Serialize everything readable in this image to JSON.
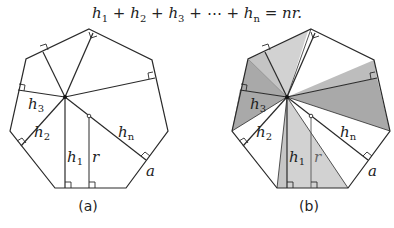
{
  "formula": {
    "h1": "h",
    "s1": "1",
    "h2": "h",
    "s2": "2",
    "h3": "h",
    "s3": "3",
    "dots": "⋯",
    "hn": "h",
    "sn": "n",
    "rhs": "nr.",
    "plus": "+",
    "eq": "="
  },
  "figures": [
    {
      "caption": "(a)",
      "labels": {
        "h1": "h",
        "h1_sub": "1",
        "h2": "h",
        "h2_sub": "2",
        "h3": "h",
        "h3_sub": "3",
        "hn": "h",
        "hn_sub": "n",
        "r": "r",
        "a": "a"
      },
      "shaded": false
    },
    {
      "caption": "(b)",
      "labels": {
        "h1": "h",
        "h1_sub": "1",
        "h2": "h",
        "h2_sub": "2",
        "h3": "h",
        "h3_sub": "3",
        "hn": "h",
        "hn_sub": "n",
        "r": "r",
        "a": "a"
      },
      "shaded": true,
      "shade_colors": {
        "dark": "#a9a9a9",
        "light": "#d2d2d2"
      }
    }
  ],
  "colors": {
    "stroke": "#2a2a2a",
    "background": "#ffffff"
  }
}
